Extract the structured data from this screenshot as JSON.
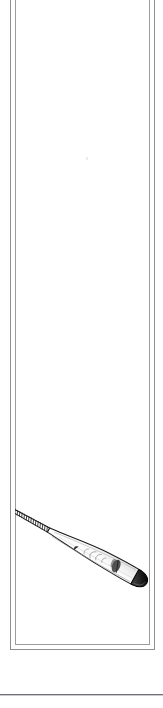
{
  "page": {
    "background_color": "#ffffff",
    "width": 163,
    "height": 708
  },
  "frame": {
    "name": "double-ruled-panel-border",
    "style": "double-line rectangle, top edge cropped",
    "outer_color": "#8d8f93",
    "inner_color": "#9a9c9f"
  },
  "illustration": {
    "subject": "baseball bat",
    "style": "black-and-white line drawing / engraving",
    "orientation": "diagonal, barrel at upper-right, knob at lower-left",
    "ink_color": "#1a1a1a",
    "shade_color": "#5a5a5a",
    "parts": {
      "end_cap_label": "barrel end cap",
      "barrel_label": "barrel",
      "logo_label": "barrel brand stamp",
      "taper_label": "taper",
      "handle_label": "handle",
      "grip_label": "grip tape wrap",
      "knob_label": "knob"
    },
    "grip_wrap_turns": 19
  },
  "separator": {
    "name": "page-bottom-rule",
    "color": "#6f7175",
    "y": 694
  },
  "artifacts": {
    "speck_label": "scan speck"
  }
}
